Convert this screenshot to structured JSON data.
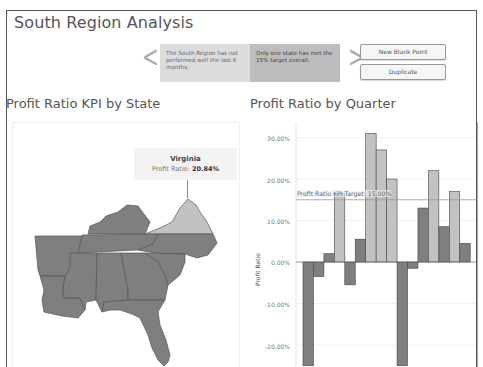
{
  "dashboard": {
    "title": "South Region Analysis"
  },
  "story": {
    "points": [
      {
        "text": "The South Region has not performed well the last 6 months."
      },
      {
        "text": "Only one state has met the 15% target overall."
      }
    ],
    "prev_icon": "chevron-left-icon",
    "next_icon": "chevron-right-icon",
    "buttons": {
      "new_blank_point": "New Blank Point",
      "duplicate": "Duplicate"
    },
    "arrow_left": "<",
    "arrow_right": ">"
  },
  "map_sheet": {
    "title": "Profit Ratio KPI by State",
    "tooltip": {
      "state": "Virginia",
      "label": "Profit Ratio: ",
      "value": "20.84%"
    },
    "colors": {
      "met": "#c2c2c2",
      "not_met": "#7f7f7f",
      "border": "#555555"
    }
  },
  "bar_sheet": {
    "title": "Profit Ratio by Quarter",
    "y_axis_label": "Profit Ratio",
    "reference_line_label": "Profit Ratio KPI Target: 15.00%",
    "y_ticks": [
      "30.00%",
      "20.00%",
      "10.00%",
      "0.00%",
      "-10.00%",
      "-20.00%"
    ]
  },
  "chart_data": {
    "type": "bar",
    "title": "Profit Ratio by Quarter",
    "xlabel": "",
    "ylabel": "Profit Ratio",
    "ylim": [
      -25,
      32
    ],
    "y_ticks": [
      -20,
      -10,
      0,
      10,
      20,
      30
    ],
    "grid": true,
    "reference_line": {
      "label": "Profit Ratio KPI Target",
      "value": 15.0
    },
    "colors": {
      "below_target": "#7f7f7f",
      "above_target": "#c2c2c2"
    },
    "values": [
      -25,
      -3.5,
      2,
      16.5,
      -5.5,
      5.5,
      31,
      27,
      20,
      -25,
      -1.5,
      13,
      22,
      8.5,
      17,
      4.5
    ]
  }
}
